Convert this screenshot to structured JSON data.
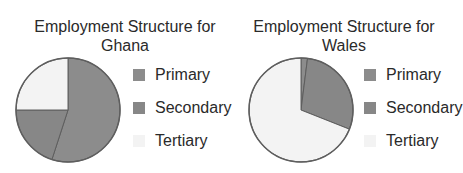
{
  "colors": {
    "primary": "#8c8c8c",
    "secondary": "#878787",
    "tertiary": "#f3f3f3",
    "outline": "#5e5e5e"
  },
  "chart_data": [
    {
      "type": "pie",
      "title": "Employment Structure for Ghana",
      "title_lines": [
        "Employment Structure for",
        "Ghana"
      ],
      "categories": [
        "Primary",
        "Secondary",
        "Tertiary"
      ],
      "values": [
        55,
        20,
        25
      ],
      "start_angle": "12 o'clock, clockwise",
      "legend_position": "right"
    },
    {
      "type": "pie",
      "title": "Employment Structure for Wales",
      "title_lines": [
        "Employment Structure for",
        "Wales"
      ],
      "categories": [
        "Primary",
        "Secondary",
        "Tertiary"
      ],
      "values": [
        2,
        29,
        69
      ],
      "start_angle": "12 o'clock, clockwise",
      "legend_position": "right"
    }
  ]
}
